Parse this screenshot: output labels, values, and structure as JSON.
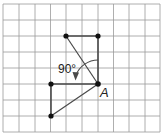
{
  "diagram": {
    "type": "rotation-on-grid",
    "grid": {
      "columns": 10,
      "rows": 8,
      "line_color": "#9a9a9a"
    },
    "labels": {
      "angle": "90°",
      "point": "A"
    },
    "center_point": {
      "name": "A",
      "x": 98,
      "y": 84
    },
    "original_shape": {
      "vertices": [
        {
          "x": 98,
          "y": 84
        },
        {
          "x": 51,
          "y": 84
        },
        {
          "x": 51,
          "y": 116
        }
      ]
    },
    "rotated_shape": {
      "vertices": [
        {
          "x": 98,
          "y": 84
        },
        {
          "x": 98,
          "y": 36
        },
        {
          "x": 66,
          "y": 36
        }
      ]
    },
    "rotation": {
      "angle_degrees": 90,
      "direction": "counterclockwise",
      "arrow": "arc-with-arrowhead"
    },
    "colors": {
      "line": "#4a4a4a",
      "point": "#111111",
      "background": "#ffffff"
    }
  }
}
